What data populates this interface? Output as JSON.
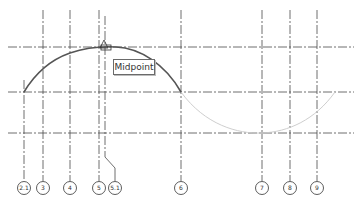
{
  "tooltip": {
    "label": "Midpoint"
  },
  "colors": {
    "grid_line": "#4a4a4a",
    "arc_selected": "#555555",
    "arc_preview": "#c8c8c8",
    "tooltip_border": "#6a6a6a"
  },
  "grids": {
    "vertical": [
      {
        "label": "2.1",
        "x": 24
      },
      {
        "label": "3",
        "x": 43
      },
      {
        "label": "4",
        "x": 70
      },
      {
        "label": "5",
        "x": 99
      },
      {
        "label": "5.1",
        "x": 105
      },
      {
        "label": "6",
        "x": 181
      },
      {
        "label": "7",
        "x": 262
      },
      {
        "label": "8",
        "x": 290
      },
      {
        "label": "9",
        "x": 317
      }
    ],
    "horizontal_y": [
      47,
      92,
      133
    ]
  },
  "snap": {
    "type": "midpoint",
    "x": 104,
    "y": 47
  }
}
